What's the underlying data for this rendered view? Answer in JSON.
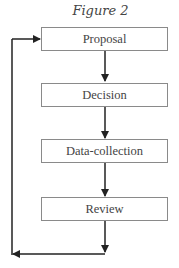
{
  "figure": {
    "title": "Figure 2",
    "steps": [
      {
        "label": "Proposal"
      },
      {
        "label": "Decision"
      },
      {
        "label": "Data-collection"
      },
      {
        "label": "Review"
      }
    ],
    "connections": [
      {
        "from": "Proposal",
        "to": "Decision"
      },
      {
        "from": "Decision",
        "to": "Data-collection"
      },
      {
        "from": "Data-collection",
        "to": "Review"
      },
      {
        "from": "Review",
        "to": "Proposal",
        "type": "feedback-loop"
      }
    ],
    "colors": {
      "line": "#222222",
      "box_border": "#8a8a8a",
      "text": "#444444"
    }
  }
}
